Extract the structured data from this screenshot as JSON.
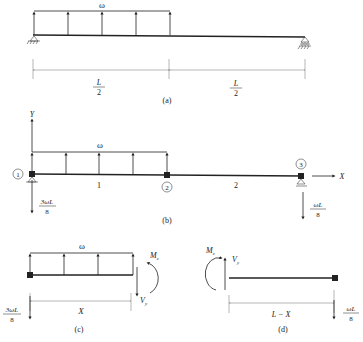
{
  "panels": {
    "a": {
      "caption": "(a)",
      "load_label": "ω",
      "dim_left_num": "L",
      "dim_left_den": "2",
      "dim_right_num": "L",
      "dim_right_den": "2"
    },
    "b": {
      "caption": "(b)",
      "load_label": "ω",
      "y_axis": "Y",
      "x_axis": "X",
      "node1": "1",
      "node2": "2",
      "node3": "3",
      "element1": "1",
      "element2": "2",
      "reaction_left_num": "3ωL",
      "reaction_left_den": "8",
      "reaction_right_num": "ωL",
      "reaction_right_den": "8"
    },
    "c": {
      "caption": "(c)",
      "load_label": "ω",
      "moment": "M",
      "moment_sub": "z",
      "shear": "V",
      "shear_sub": "y",
      "dim": "X",
      "reaction_num": "3ωL",
      "reaction_den": "8"
    },
    "d": {
      "caption": "(d)",
      "moment": "M",
      "moment_sub": "z",
      "shear": "V",
      "shear_sub": "y",
      "dim": "L − X",
      "reaction_num": "ωL",
      "reaction_den": "8"
    }
  },
  "colors": {
    "line": "#222222",
    "dim_line": "#888888",
    "background": "#ffffff"
  }
}
